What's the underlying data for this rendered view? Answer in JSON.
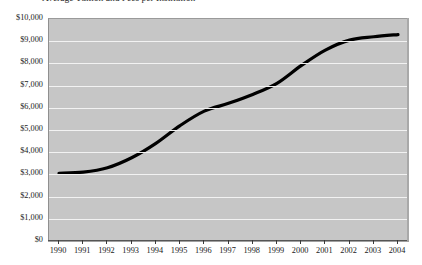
{
  "chart_data": {
    "type": "line",
    "title": "",
    "title_clipped_fragment": "Average Tuition and Fees per Institution",
    "xlabel": "",
    "ylabel": "",
    "categories": [
      "1990",
      "1991",
      "1992",
      "1993",
      "1994",
      "1995",
      "1996",
      "1997",
      "1998",
      "1999",
      "2000",
      "2001",
      "2002",
      "2003",
      "2004"
    ],
    "values": [
      3050,
      3100,
      3300,
      3750,
      4400,
      5200,
      5850,
      6200,
      6600,
      7100,
      7900,
      8600,
      9050,
      9200,
      9300
    ],
    "ylim": [
      0,
      10000
    ],
    "ytick_values": [
      0,
      1000,
      2000,
      3000,
      4000,
      5000,
      6000,
      7000,
      8000,
      9000,
      10000
    ],
    "ytick_labels": [
      "$0",
      "$1,000",
      "$2,000",
      "$3,000",
      "$4,000",
      "$5,000",
      "$6,000",
      "$7,000",
      "$8,000",
      "$9,000",
      "$10,000"
    ],
    "grid": true,
    "legend": false,
    "legend_position": "none",
    "series_color": "#000000",
    "plot_background_color": "#c6c6c6",
    "gridline_color": "#f2f2f2",
    "page_background_color": "#ffffff"
  }
}
